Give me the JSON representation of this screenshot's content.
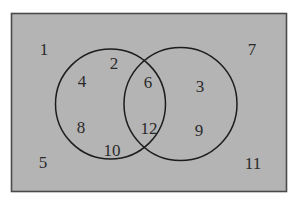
{
  "figure": {
    "type": "venn-diagram",
    "background_outer_color": "#ffffff",
    "universe_fill_color": "#b4b4b4",
    "stroke_color": "#1c1c1c",
    "label_color": "#2a2a2a"
  },
  "universe": {
    "name": "universal-set-rectangle",
    "x": 11,
    "y": 13,
    "width": 276,
    "height": 179
  },
  "circles": [
    {
      "name": "left-circle",
      "cx": 110.5,
      "cy": 104,
      "r": 55
    },
    {
      "name": "right-circle",
      "cx": 180.5,
      "cy": 104,
      "r": 56.5
    }
  ],
  "chart_data": {
    "type": "venn",
    "sets": [
      "left-circle",
      "right-circle"
    ],
    "regions": [
      {
        "region": "outside",
        "values": [
          1,
          5,
          7,
          11
        ]
      },
      {
        "region": "left-only",
        "values": [
          2,
          4,
          8,
          10
        ]
      },
      {
        "region": "intersection",
        "values": [
          6,
          12
        ]
      },
      {
        "region": "right-only",
        "values": [
          3,
          9
        ]
      }
    ],
    "counts": {
      "outside": 4,
      "left-only": 4,
      "intersection": 2,
      "right-only": 2
    }
  },
  "labels": [
    {
      "id": "label-1",
      "text": "1",
      "x": 44,
      "y": 49,
      "region": "outside"
    },
    {
      "id": "label-2",
      "text": "2",
      "x": 114,
      "y": 63,
      "region": "left-only"
    },
    {
      "id": "label-3",
      "text": "3",
      "x": 200,
      "y": 86,
      "region": "right-only"
    },
    {
      "id": "label-4",
      "text": "4",
      "x": 82,
      "y": 81,
      "region": "left-only"
    },
    {
      "id": "label-5",
      "text": "5",
      "x": 43,
      "y": 162,
      "region": "outside"
    },
    {
      "id": "label-6",
      "text": "6",
      "x": 148,
      "y": 82,
      "region": "intersection"
    },
    {
      "id": "label-7",
      "text": "7",
      "x": 252,
      "y": 49,
      "region": "outside"
    },
    {
      "id": "label-8",
      "text": "8",
      "x": 81,
      "y": 127,
      "region": "left-only"
    },
    {
      "id": "label-9",
      "text": "9",
      "x": 199,
      "y": 130,
      "region": "right-only"
    },
    {
      "id": "label-10",
      "text": "10",
      "x": 112,
      "y": 150,
      "region": "left-only"
    },
    {
      "id": "label-11",
      "text": "11",
      "x": 253,
      "y": 163,
      "region": "outside"
    },
    {
      "id": "label-12",
      "text": "12",
      "x": 149,
      "y": 128,
      "region": "intersection"
    }
  ]
}
